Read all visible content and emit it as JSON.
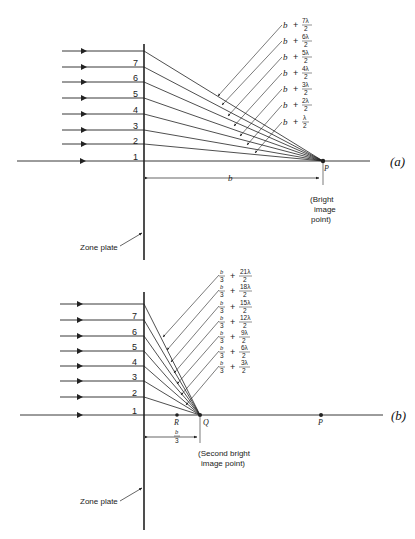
{
  "figure": {
    "panel_a": {
      "tag": "(a)",
      "zone_numbers": [
        "1",
        "2",
        "3",
        "4",
        "5",
        "6",
        "7"
      ],
      "path_labels": [
        {
          "base": "b",
          "plus": "+",
          "num": "7λ",
          "den": "2"
        },
        {
          "base": "b",
          "plus": "+",
          "num": "6λ",
          "den": "2"
        },
        {
          "base": "b",
          "plus": "+",
          "num": "5λ",
          "den": "2"
        },
        {
          "base": "b",
          "plus": "+",
          "num": "4λ",
          "den": "2"
        },
        {
          "base": "b",
          "plus": "+",
          "num": "3λ",
          "den": "2"
        },
        {
          "base": "b",
          "plus": "+",
          "num": "2λ",
          "den": "2"
        },
        {
          "base": "b",
          "plus": "+",
          "num": "λ",
          "den": "2"
        }
      ],
      "point_label": "P",
      "distance_label": "b",
      "note_lines": [
        "(Bright",
        "image",
        "point)"
      ],
      "zone_plate_label": "Zone plate"
    },
    "panel_b": {
      "tag": "(b)",
      "zone_numbers": [
        "1",
        "2",
        "3",
        "4",
        "5",
        "6",
        "7"
      ],
      "path_labels": [
        {
          "bnum": "b",
          "bden": "3",
          "plus": "+",
          "num": "21λ",
          "den": "2"
        },
        {
          "bnum": "b",
          "bden": "3",
          "plus": "+",
          "num": "18λ",
          "den": "2"
        },
        {
          "bnum": "b",
          "bden": "3",
          "plus": "+",
          "num": "15λ",
          "den": "2"
        },
        {
          "bnum": "b",
          "bden": "3",
          "plus": "+",
          "num": "12λ",
          "den": "2"
        },
        {
          "bnum": "b",
          "bden": "3",
          "plus": "+",
          "num": "9λ",
          "den": "2"
        },
        {
          "bnum": "b",
          "bden": "3",
          "plus": "+",
          "num": "6λ",
          "den": "2"
        },
        {
          "bnum": "b",
          "bden": "3",
          "plus": "+",
          "num": "3λ",
          "den": "2"
        }
      ],
      "point_labels": {
        "R": "R",
        "Q": "Q",
        "P": "P"
      },
      "distance_label": {
        "num": "b",
        "den": "3"
      },
      "note_lines": [
        "(Second bright",
        "image point)"
      ],
      "zone_plate_label": "Zone plate"
    },
    "colors": {
      "ink": "#222222",
      "background": "#ffffff"
    }
  }
}
